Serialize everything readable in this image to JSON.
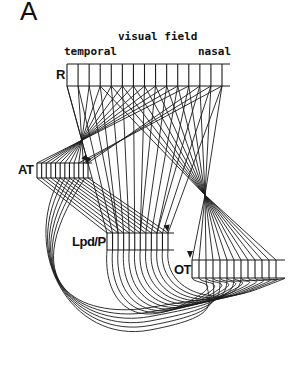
{
  "figure": {
    "panel_label": "A",
    "title": "visual field",
    "axis_left": "temporal",
    "axis_right": "nasal",
    "structures": [
      {
        "id": "R",
        "label": "R"
      },
      {
        "id": "AT",
        "label": "AT"
      },
      {
        "id": "LpdP",
        "label": "Lpd/P"
      },
      {
        "id": "OT",
        "label": "OT"
      }
    ]
  },
  "colors": {
    "ink": "#1a1a1a",
    "background": "#ffffff"
  }
}
